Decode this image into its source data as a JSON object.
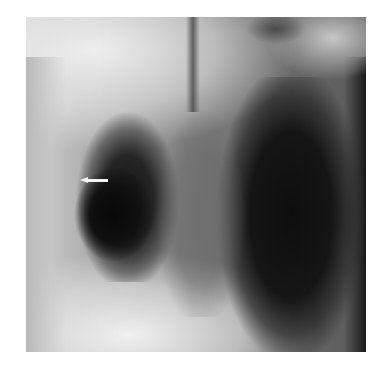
{
  "image": {
    "kind": "chest radiograph",
    "description": "Frontal chest X-ray with a white arrow pointing left toward a lucent area in the right (image-left) lung field",
    "annotation": {
      "type": "arrow",
      "direction": "left",
      "color": "#f4f4f4"
    },
    "colors": {
      "background": "#ffffff",
      "lung_dark": "#0e0e0e",
      "bone_bright": "#eeeeee",
      "soft_tissue": "#8a8a8a"
    }
  }
}
